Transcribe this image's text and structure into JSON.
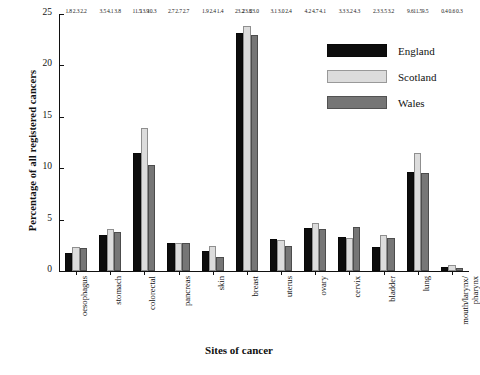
{
  "chart_data": {
    "type": "bar",
    "title": "",
    "xlabel": "Sites of cancer",
    "ylabel": "Percentage of all registered cancers",
    "ylim": [
      0,
      25
    ],
    "yticks": [
      0,
      5,
      10,
      15,
      20,
      25
    ],
    "grid": false,
    "legend_position": "top-right",
    "categories": [
      "oesophagus",
      "stomach",
      "colorectal",
      "pancreas",
      "skin",
      "breast",
      "uterus",
      "ovary",
      "cervix",
      "bladder",
      "lung",
      "mouth/larynx/\npharynx"
    ],
    "series": [
      {
        "name": "England",
        "color": "#0d0d0d",
        "values": [
          1.8,
          3.5,
          11.5,
          2.7,
          1.9,
          23.2,
          3.1,
          4.2,
          3.3,
          2.3,
          9.6,
          0.4
        ]
      },
      {
        "name": "Scotland",
        "color": "#dcdcdc",
        "values": [
          2.3,
          4.1,
          13.9,
          2.7,
          2.4,
          23.8,
          3.0,
          4.7,
          3.2,
          3.5,
          11.5,
          0.6
        ]
      },
      {
        "name": "Wales",
        "color": "#767676",
        "values": [
          2.2,
          3.8,
          10.3,
          2.7,
          1.4,
          23.0,
          2.4,
          4.1,
          4.3,
          3.2,
          9.5,
          0.3
        ]
      }
    ]
  },
  "legend": {
    "items": [
      {
        "label": "England"
      },
      {
        "label": "Scotland"
      },
      {
        "label": "Wales"
      }
    ]
  },
  "axes": {
    "y_title": "Percentage of all registered cancers",
    "x_title": "Sites of cancer"
  }
}
